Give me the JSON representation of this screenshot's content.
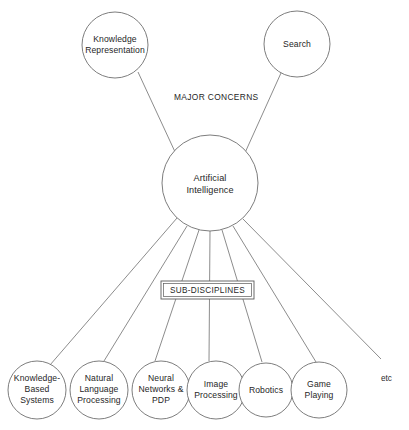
{
  "diagram": {
    "line_color": "#6e6e6e",
    "text_color": "#262626",
    "background": "#ffffff",
    "center_node": {
      "label": "Artificial\nIntelligence",
      "cx": 210,
      "cy": 183,
      "r": 48
    },
    "major_concerns": {
      "caption": "MAJOR CONCERNS",
      "caption_x": 174,
      "caption_y": 92,
      "nodes": [
        {
          "label": "Knowledge\nRepresentation",
          "cx": 115,
          "cy": 45,
          "r": 33
        },
        {
          "label": "Search",
          "cx": 297,
          "cy": 44,
          "r": 33
        }
      ]
    },
    "sub_disciplines": {
      "caption": "SUB-DISCIPLINES",
      "box": {
        "x": 161,
        "y": 281,
        "w": 93,
        "h": 18
      },
      "nodes": [
        {
          "label": "Knowledge-\nBased\nSystems",
          "cx": 37,
          "cy": 390,
          "r": 29
        },
        {
          "label": "Natural\nLanguage\nProcessing",
          "cx": 99,
          "cy": 390,
          "r": 29
        },
        {
          "label": "Neural\nNetworks &\nPDP",
          "cx": 161,
          "cy": 390,
          "r": 29
        },
        {
          "label": "Image\nProcessing",
          "cx": 216,
          "cy": 390,
          "r": 29
        },
        {
          "label": "Robotics",
          "cx": 266,
          "cy": 390,
          "r": 27
        },
        {
          "label": "Game\nPlaying",
          "cx": 319,
          "cy": 390,
          "r": 28
        }
      ],
      "etc": {
        "label": "etc",
        "x": 381,
        "y": 374
      }
    }
  }
}
